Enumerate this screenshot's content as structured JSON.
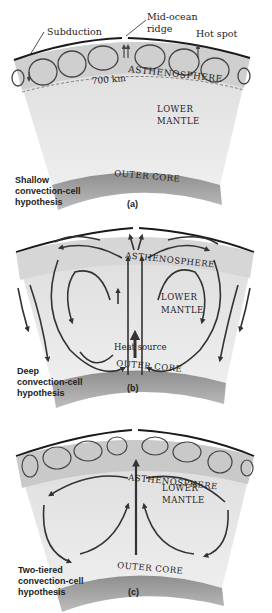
{
  "panels": [
    {
      "id": "a",
      "panel_label": "(a)",
      "caption_lines": [
        "Shallow",
        "convection-cell",
        "hypothesis"
      ],
      "labels": {
        "subduction": "Subduction",
        "mid_ocean_ridge_1": "Mid-ocean",
        "mid_ocean_ridge_2": "ridge",
        "hot_spot": "Hot spot",
        "asthenosphere": "ASTHENOSPHERE",
        "depth": "700 km",
        "lower_mantle_1": "LOWER",
        "lower_mantle_2": "MANTLE",
        "outer_core": "OUTER CORE"
      }
    },
    {
      "id": "b",
      "panel_label": "(b)",
      "caption_lines": [
        "Deep",
        "convection-cell",
        "hypothesis"
      ],
      "labels": {
        "asthenosphere": "ASTHENOSPHERE",
        "lower_mantle_1": "LOWER",
        "lower_mantle_2": "MANTLE",
        "heat_source": "Heat source",
        "outer_core": "OUTER CORE"
      }
    },
    {
      "id": "c",
      "panel_label": "(c)",
      "caption_lines": [
        "Two-tiered",
        "convection-cell",
        "hypothesis"
      ],
      "labels": {
        "asthenosphere": "ASTHENOSPHERE",
        "lower_mantle_1": "LOWER",
        "lower_mantle_2": "MANTLE",
        "outer_core": "OUTER CORE"
      }
    }
  ],
  "colors": {
    "mantle": "#e4e4e4",
    "asthenosphere": "#d2d2d2",
    "outer_core": "#9a9a9a",
    "arrows": "#444444",
    "crust": "#1a1a1a"
  }
}
